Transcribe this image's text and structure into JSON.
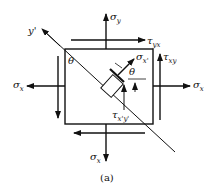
{
  "figure": {
    "caption": "(a)",
    "colors": {
      "stroke": "#111111",
      "background": "#ffffff"
    },
    "labels": {
      "sigma_y_top": {
        "main": "σ",
        "sub": "y"
      },
      "tau_yx": {
        "main": "τ",
        "sub": "yx"
      },
      "tau_xy": {
        "main": "τ",
        "sub": "xy"
      },
      "sigma_x_right": {
        "main": "σ",
        "sub": "x"
      },
      "sigma_x_left": {
        "main": "σ",
        "sub": "x"
      },
      "sigma_x_bottom": {
        "main": "σ",
        "sub": "x"
      },
      "sigma_x_prime": {
        "main": "σ",
        "sub": "x'"
      },
      "tau_x_prime_y_prime": {
        "main": "τ",
        "sub": "x'y'"
      },
      "y_prime_axis": "y'",
      "theta_corner": "θ",
      "theta_element": "θ"
    }
  }
}
